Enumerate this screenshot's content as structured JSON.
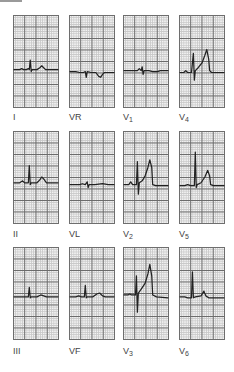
{
  "figure": {
    "layout": "3 rows x 4 columns",
    "leads": [
      {
        "id": "I",
        "label": "I",
        "sub": "",
        "row": 0,
        "col": 0
      },
      {
        "id": "aVR",
        "label": "VR",
        "sub": "",
        "row": 0,
        "col": 1
      },
      {
        "id": "V1",
        "label": "V",
        "sub": "1",
        "row": 0,
        "col": 2
      },
      {
        "id": "V4",
        "label": "V",
        "sub": "4",
        "row": 0,
        "col": 3
      },
      {
        "id": "II",
        "label": "II",
        "sub": "",
        "row": 1,
        "col": 0
      },
      {
        "id": "aVL",
        "label": "VL",
        "sub": "",
        "row": 1,
        "col": 1
      },
      {
        "id": "V2",
        "label": "V",
        "sub": "2",
        "row": 1,
        "col": 2
      },
      {
        "id": "V5",
        "label": "V",
        "sub": "5",
        "row": 1,
        "col": 3
      },
      {
        "id": "III",
        "label": "III",
        "sub": "",
        "row": 2,
        "col": 0
      },
      {
        "id": "aVF",
        "label": "VF",
        "sub": "",
        "row": 2,
        "col": 1
      },
      {
        "id": "V3",
        "label": "V",
        "sub": "3",
        "row": 2,
        "col": 2
      },
      {
        "id": "V6",
        "label": "V",
        "sub": "6",
        "row": 2,
        "col": 3
      }
    ]
  },
  "colors": {
    "grid_major": "#6a6a6a",
    "grid_minor": "#c8c8c8",
    "paper": "#f2f2f2",
    "trace": "#222222"
  }
}
